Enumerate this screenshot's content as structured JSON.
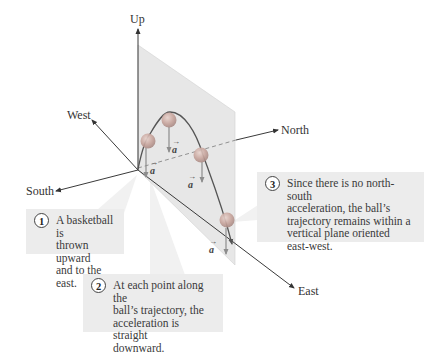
{
  "diagram": {
    "axes": {
      "up": "Up",
      "west": "West",
      "north": "North",
      "south": "South",
      "east": "East"
    },
    "acceleration_symbol": "a",
    "callouts": [
      {
        "number": "1",
        "text": "A basketball is\nthrown upward\nand to the east."
      },
      {
        "number": "2",
        "text": "At each point along the\nball’s trajectory, the\nacceleration is straight\ndownward."
      },
      {
        "number": "3",
        "text": "Since there is no north-south\nacceleration, the ball’s\ntrajectory remains within a\nvertical plane oriented\neast-west."
      }
    ],
    "colors": {
      "plane": "#e6e6e6",
      "axis": "#3a3a3a",
      "ball": "#c9a7a0",
      "trajectory": "#555555",
      "acceleration_arrow": "#9a9a9a",
      "callout_bg": "#ececec"
    }
  }
}
